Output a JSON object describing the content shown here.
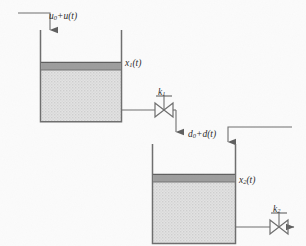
{
  "figure": {
    "background_color": "#fbfbfb",
    "line_color": "#6e6e6e",
    "liquid_band_color": "#9a9a9a",
    "liquid_fill_color": "#d9d9d9",
    "text_color": "#2b2b2b"
  },
  "labels": {
    "inlet_flow": "u",
    "inlet_flow_sub": "0",
    "inlet_flow_rest": "+u(t)",
    "tank1_level": "x",
    "tank1_level_sub": "1",
    "tank1_level_rest": "(t)",
    "valve1": "k",
    "valve1_sub": "1",
    "disturbance_flow": "d",
    "disturbance_flow_sub": "0",
    "disturbance_flow_rest": "+d(t)",
    "tank2_level": "x",
    "tank2_level_sub": "2",
    "tank2_level_rest": "(t)",
    "valve2": "k",
    "valve2_sub": "2"
  },
  "components": {
    "tank1": {
      "name": "tank-1",
      "x": 40,
      "y": 30,
      "width": 82,
      "height": 92,
      "liquid_surface_y": 62,
      "band_height": 8
    },
    "tank2": {
      "name": "tank-2",
      "x": 152,
      "y": 144,
      "width": 84,
      "height": 100,
      "liquid_surface_y": 174,
      "band_height": 8
    },
    "valve1": {
      "name": "valve-k1",
      "cx": 164,
      "cy": 110,
      "half_width": 9,
      "half_height": 7
    },
    "valve2": {
      "name": "valve-k2",
      "cx": 279,
      "cy": 227,
      "half_width": 9,
      "half_height": 7
    },
    "inlet_pipe": {
      "name": "inlet-pipe-tank1",
      "from_x": 18,
      "y": 13,
      "corner_x": 50,
      "arrow_tip_y": 36
    },
    "transfer_pipe": {
      "name": "transfer-pipe-tank1-to-tank2",
      "start_x": 122,
      "y": 110,
      "corner_x": 176,
      "arrow_tip_y": 140
    },
    "disturbance_pipe": {
      "name": "disturbance-pipe-tank2",
      "from_x": 292,
      "y": 127,
      "corner_x": 228,
      "arrow_tip_y": 150
    },
    "outlet_pipe": {
      "name": "outlet-pipe-tank2",
      "start_x": 236,
      "y": 227,
      "arrow_tip_x": 300
    }
  }
}
